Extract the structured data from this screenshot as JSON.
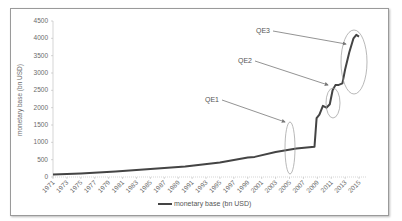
{
  "chart_data": {
    "type": "line",
    "title": "",
    "xlabel": "",
    "ylabel": "monetary base (bn USD)",
    "ylim": [
      0,
      4500
    ],
    "yticks": [
      0,
      500,
      1000,
      1500,
      2000,
      2500,
      3000,
      3500,
      4000,
      4500
    ],
    "xticks": [
      "1971",
      "1973",
      "1975",
      "1977",
      "1979",
      "1981",
      "1983",
      "1985",
      "1987",
      "1989",
      "1991",
      "1993",
      "1995",
      "1997",
      "1999",
      "2001",
      "2003",
      "2005",
      "2007",
      "2009",
      "2011",
      "2013",
      "2015"
    ],
    "grid": false,
    "legend_position": "bottom",
    "series": [
      {
        "name": "monetary base (bn USD)",
        "color": "#444444",
        "x": [
          1971,
          1975,
          1980,
          1985,
          1990,
          1995,
          1999,
          2000,
          2003,
          2006,
          2008.6,
          2008.9,
          2009.3,
          2009.8,
          2010.3,
          2010.8,
          2011.2,
          2011.6,
          2012.0,
          2012.6,
          2013.0,
          2013.6,
          2014.2,
          2014.6,
          2015.0
        ],
        "values": [
          70,
          100,
          160,
          230,
          300,
          420,
          560,
          580,
          720,
          820,
          870,
          1700,
          1800,
          2050,
          2000,
          2100,
          2500,
          2650,
          2650,
          2700,
          3100,
          3600,
          4000,
          4100,
          4050
        ]
      }
    ],
    "annotations": [
      {
        "label": "QE1",
        "target_year": 2009
      },
      {
        "label": "QE2",
        "target_year": 2011
      },
      {
        "label": "QE3",
        "target_year": 2013.5
      }
    ]
  },
  "legend": {
    "label": "monetary base (bn USD)"
  },
  "axis": {
    "ylabel": "monetary base (bn USD)"
  },
  "annotations": {
    "qe1": "QE1",
    "qe2": "QE2",
    "qe3": "QE3"
  }
}
